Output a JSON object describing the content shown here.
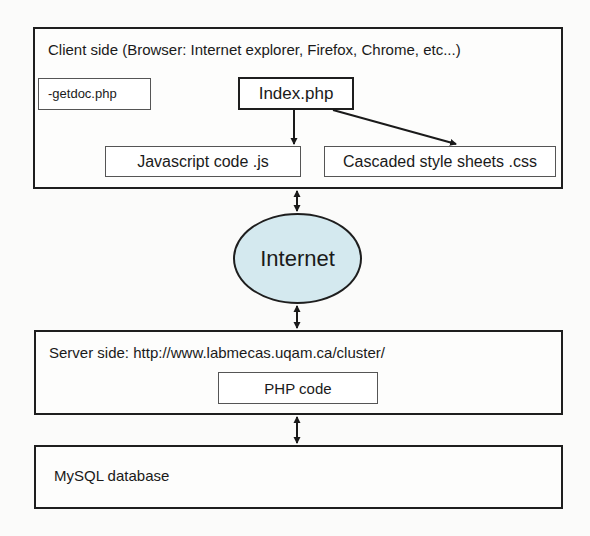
{
  "diagram": {
    "client": {
      "title": "Client side (Browser: Internet explorer, Firefox, Chrome, etc...)",
      "getdoc": "-getdoc.php",
      "index": "Index.php",
      "javascript": "Javascript code .js",
      "css": "Cascaded style sheets .css"
    },
    "network": {
      "label": "Internet",
      "fill_color": "#d4e9ef"
    },
    "server": {
      "title": "Server side: http://www.labmecas.uqam.ca/cluster/",
      "php": "PHP code"
    },
    "database": {
      "title": "MySQL database"
    },
    "edges": [
      {
        "from": "Index.php",
        "to": "Javascript code .js",
        "type": "directed"
      },
      {
        "from": "Index.php",
        "to": "Cascaded style sheets .css",
        "type": "directed"
      },
      {
        "from": "Client side",
        "to": "Internet",
        "type": "bidirectional"
      },
      {
        "from": "Internet",
        "to": "Server side",
        "type": "bidirectional"
      },
      {
        "from": "Server side",
        "to": "MySQL database",
        "type": "bidirectional"
      }
    ]
  }
}
